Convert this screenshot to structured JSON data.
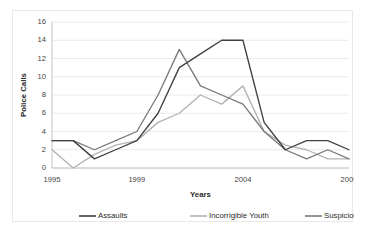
{
  "chart_data": {
    "type": "line",
    "title": "",
    "xlabel": "Years",
    "ylabel": "Police Calls",
    "x": [
      1995,
      1996,
      1997,
      1998,
      1999,
      2000,
      2001,
      2002,
      2003,
      2004,
      2005,
      2006,
      2007,
      2008,
      2009
    ],
    "xtick_labels": [
      "1995",
      "1999",
      "2004",
      "2009"
    ],
    "xtick_values": [
      1995,
      1999,
      2004,
      2009
    ],
    "ytick_labels": [
      "0",
      "2",
      "4",
      "6",
      "8",
      "10",
      "12",
      "14",
      "16"
    ],
    "ytick_values": [
      0,
      2,
      4,
      6,
      8,
      10,
      12,
      14,
      16
    ],
    "xlim": [
      1995,
      2009
    ],
    "ylim": [
      0,
      16
    ],
    "grid": "horizontal",
    "legend_position": "bottom",
    "series": [
      {
        "name": "Assaults",
        "color": "#404040",
        "values": [
          3,
          3,
          1,
          2,
          3,
          6,
          11,
          12.5,
          14,
          14,
          5,
          2,
          3,
          3,
          2
        ]
      },
      {
        "name": "Incorrigible Youth",
        "color": "#b3b3b3",
        "values": [
          2,
          0,
          1.5,
          2.5,
          3,
          5,
          6,
          8,
          7,
          9,
          4,
          2.5,
          2,
          1,
          1
        ]
      },
      {
        "name": "Suspicious Activity",
        "color": "#7a7a7a",
        "values": [
          3,
          3,
          2,
          3,
          4,
          8,
          13,
          9,
          8,
          7,
          4,
          2,
          1,
          2,
          1
        ]
      }
    ]
  },
  "axes": {
    "ylabel": "Police Calls",
    "xlabel": "Years"
  },
  "legend": {
    "items": [
      {
        "label": "Assaults"
      },
      {
        "label": "Incorrigible Youth"
      },
      {
        "label": "Suspicious Activity"
      }
    ]
  }
}
